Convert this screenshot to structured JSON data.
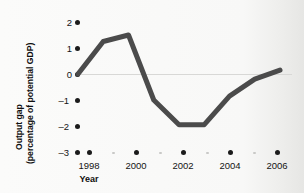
{
  "chart_data": {
    "type": "line",
    "title": "",
    "xlabel": "Year",
    "ylabel": "Output gap (percentage of potential GDP)",
    "ylabel_line1": "Output gap",
    "ylabel_line2": "(percentage of potential GDP)",
    "x": [
      1998,
      1999,
      2000,
      2001,
      2002,
      2003,
      2004,
      2005,
      2006
    ],
    "values": [
      0.0,
      1.25,
      1.5,
      -1.0,
      -1.95,
      -1.95,
      -0.85,
      -0.2,
      0.15
    ],
    "categories": [
      "1998",
      "1999",
      "2000",
      "2001",
      "2002",
      "2003",
      "2004",
      "2005",
      "2006"
    ],
    "xlim": [
      1998,
      2006
    ],
    "ylim": [
      -3,
      2
    ],
    "yticks": [
      2,
      1,
      0,
      -1,
      -2,
      -3
    ],
    "ytick_labels": [
      "2",
      "1",
      "0",
      "–1",
      "–2",
      "–3"
    ],
    "xticks": [
      1998,
      2000,
      2002,
      2004,
      2006
    ],
    "xtick_labels": [
      "1998",
      "2000",
      "2002",
      "2004",
      "2006"
    ],
    "xtick_minor": [
      1999,
      2001,
      2003,
      2005
    ],
    "grid": false,
    "legend": "none",
    "zero_reference_line": true,
    "line_color": "#4b4b4b",
    "line_width": 5,
    "tick_marker": "dot",
    "tick_marker_color": "#1b1b1b"
  },
  "axis": {
    "y_tick_0": "2",
    "y_tick_1": "1",
    "y_tick_2": "0",
    "y_tick_3": "–1",
    "y_tick_4": "–2",
    "y_tick_5": "–3",
    "x_tick_0": "1998",
    "x_tick_1": "2000",
    "x_tick_2": "2002",
    "x_tick_3": "2004",
    "x_tick_4": "2006",
    "x_title": "Year",
    "y_title_line1": "Output gap",
    "y_title_line2": "(percentage of potential GDP)"
  }
}
